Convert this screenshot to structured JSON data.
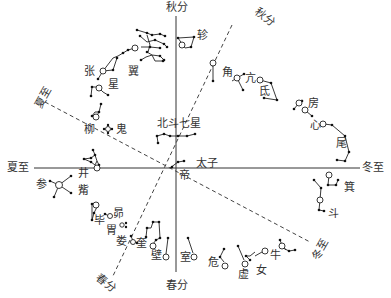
{
  "diagram": {
    "type": "star-map",
    "axes": {
      "vertical_top": "秋分",
      "vertical_bottom": "春分",
      "horizontal_left": "夏至",
      "horizontal_right": "冬至",
      "diag_up_right": "秋分",
      "diag_down_left": "春分",
      "diag_up_left": "夏至",
      "diag_down_right": "冬至"
    },
    "center_labels": {
      "big_dipper": "北斗七星",
      "taizi": "太子",
      "di": "帝"
    },
    "mansions": [
      {
        "id": "jiao",
        "label": "角"
      },
      {
        "id": "kang",
        "label": "亢"
      },
      {
        "id": "di",
        "label": "氐"
      },
      {
        "id": "fang",
        "label": "房"
      },
      {
        "id": "xin",
        "label": "心"
      },
      {
        "id": "wei",
        "label": "尾"
      },
      {
        "id": "ji",
        "label": "箕"
      },
      {
        "id": "dou",
        "label": "斗"
      },
      {
        "id": "niu",
        "label": "牛"
      },
      {
        "id": "nv",
        "label": "女"
      },
      {
        "id": "xu",
        "label": "虚"
      },
      {
        "id": "wei2",
        "label": "危"
      },
      {
        "id": "shi",
        "label": "室"
      },
      {
        "id": "bi",
        "label": "壁"
      },
      {
        "id": "kui",
        "label": "奎"
      },
      {
        "id": "lou",
        "label": "娄"
      },
      {
        "id": "wei3",
        "label": "胃"
      },
      {
        "id": "mao",
        "label": "昴"
      },
      {
        "id": "bi2",
        "label": "毕"
      },
      {
        "id": "zi",
        "label": "觜"
      },
      {
        "id": "shen",
        "label": "参"
      },
      {
        "id": "jing",
        "label": "井"
      },
      {
        "id": "gui",
        "label": "鬼"
      },
      {
        "id": "liu",
        "label": "柳"
      },
      {
        "id": "xing",
        "label": "星"
      },
      {
        "id": "zhang",
        "label": "张"
      },
      {
        "id": "yi",
        "label": "翼"
      },
      {
        "id": "zhen",
        "label": "轸"
      }
    ]
  }
}
